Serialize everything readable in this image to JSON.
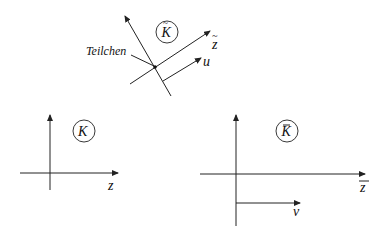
{
  "top_frame": {
    "frame_label": "K",
    "frame_accent": "~",
    "axis_label": "z",
    "axis_accent": "~",
    "particle_label": "Teilchen",
    "velocity_label": "u"
  },
  "bottom_left_frame": {
    "frame_label": "K",
    "axis_label": "z"
  },
  "bottom_right_frame": {
    "frame_label": "K",
    "frame_accent": "¯",
    "axis_label": "z",
    "axis_accent": "¯",
    "velocity_label": "v"
  },
  "colors": {
    "ink": "#222222",
    "background": "#ffffff"
  }
}
